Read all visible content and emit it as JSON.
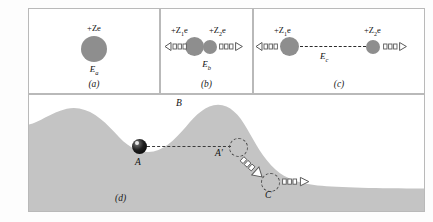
{
  "figure": {
    "panels": [
      {
        "id": "a",
        "caption": "(a)",
        "charge_label": "+Ze",
        "energy_label": "E",
        "energy_sub": "a",
        "description": "single compound nucleus at rest"
      },
      {
        "id": "b",
        "caption": "(b)",
        "charge_left": "+Z",
        "charge_left_sub": "1",
        "charge_left_tail": "e",
        "charge_right": "+Z",
        "charge_right_sub": "2",
        "charge_right_tail": "e",
        "energy_label": "E",
        "energy_sub": "b",
        "description": "nucleus split into two touching fragments moving apart"
      },
      {
        "id": "c",
        "caption": "(c)",
        "charge_left": "+Z",
        "charge_left_sub": "1",
        "charge_left_tail": "e",
        "charge_right": "+Z",
        "charge_right_sub": "2",
        "charge_right_tail": "e",
        "energy_label": "E",
        "energy_sub": "c",
        "description": "fragments separated at distance, Coulomb repulsion"
      },
      {
        "id": "d",
        "caption": "(d)",
        "description": "potential energy landscape analogy with ball",
        "points": [
          {
            "name": "A",
            "label": "A",
            "role": "ball resting in potential well"
          },
          {
            "name": "B",
            "label": "B",
            "role": "barrier peak"
          },
          {
            "name": "A-prime",
            "label": "A'",
            "role": "ball at barrier top moving outward"
          },
          {
            "name": "C",
            "label": "C",
            "role": "ball on the lower plateau moving away"
          }
        ]
      }
    ],
    "colors": {
      "nucleus_fill": "#8e8e8e",
      "terrain_fill": "#c4c4c4",
      "ball_fill": "#111111",
      "panel_border": "#b9b9b9",
      "dash_stroke": "#2b2b2b"
    }
  }
}
